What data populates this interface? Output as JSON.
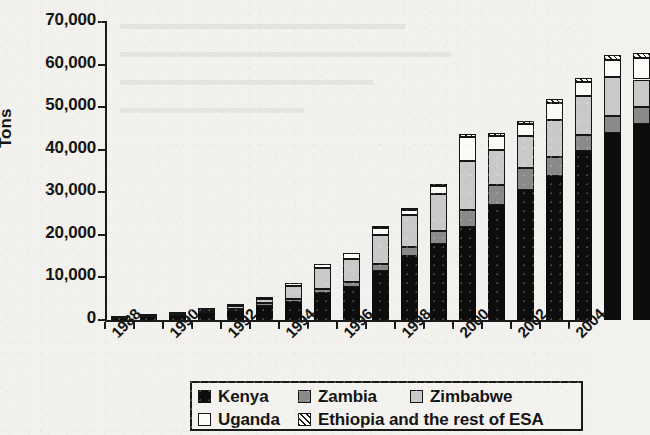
{
  "chart_data": {
    "type": "bar",
    "subtype": "stacked-column",
    "title": "",
    "xlabel": "",
    "ylabel": "Tons",
    "ylim": [
      0,
      70000
    ],
    "ytick_step": 10000,
    "ytick_labels": [
      "0",
      "10,000",
      "20,000",
      "30,000",
      "40,000",
      "50,000",
      "60,000",
      "70,000"
    ],
    "ytick_values": [
      0,
      10000,
      20000,
      30000,
      40000,
      50000,
      60000,
      70000
    ],
    "grid": false,
    "legend_position": "bottom",
    "x_label_rotation": -45,
    "note": "Right edge of plot is cropped; final column is clipped by the image border.",
    "categories": [
      1988,
      1989,
      1990,
      1991,
      1992,
      1993,
      1994,
      1995,
      1996,
      1997,
      1998,
      1999,
      2000,
      2001,
      2002,
      2003,
      2004,
      2005,
      2006
    ],
    "xtick_labels_shown": [
      "1988",
      "1990",
      "1992",
      "1994",
      "1996",
      "1998",
      "2000",
      "2002",
      "2004"
    ],
    "series": [
      {
        "name": "Kenya",
        "color": "#0d0d0d",
        "pattern": "solid",
        "values": [
          300,
          600,
          900,
          1600,
          2200,
          3400,
          4200,
          6400,
          7700,
          11500,
          15000,
          17800,
          21800,
          27000,
          30500,
          33800,
          39800,
          44000,
          46000
        ]
      },
      {
        "name": "Zambia",
        "color": "#8a8a8a",
        "pattern": "solid",
        "values": [
          100,
          150,
          250,
          300,
          400,
          500,
          700,
          900,
          1200,
          1600,
          2200,
          3200,
          4100,
          4800,
          5200,
          4400,
          3600,
          3900,
          4000
        ]
      },
      {
        "name": "Zimbabwe",
        "color": "#c9c9c9",
        "pattern": "solid",
        "values": [
          100,
          150,
          300,
          500,
          800,
          1000,
          3200,
          4900,
          5400,
          6900,
          7400,
          8600,
          11400,
          8200,
          7600,
          8900,
          9200,
          9100,
          6500
        ]
      },
      {
        "name": "Uganda",
        "color": "#fbfbf8",
        "pattern": "solid",
        "values": [
          50,
          100,
          150,
          200,
          250,
          350,
          700,
          1000,
          1500,
          1600,
          1300,
          1800,
          5600,
          3200,
          2800,
          3900,
          3200,
          4000,
          5000
        ]
      },
      {
        "name": "Ethiopia and the rest of ESA",
        "color": "#fbfbf8",
        "pattern": "diagonal-hatch",
        "values": [
          0,
          0,
          0,
          0,
          0,
          0,
          0,
          0,
          0,
          200,
          200,
          300,
          700,
          800,
          700,
          900,
          1100,
          1200,
          1300
        ]
      }
    ],
    "totals": [
      550,
      1000,
      1600,
      2600,
      3650,
      5250,
      8800,
      13200,
      15800,
      21800,
      26100,
      31700,
      43600,
      44000,
      46800,
      51900,
      56900,
      62200,
      62800
    ]
  },
  "legend": {
    "items": [
      {
        "label": "Kenya",
        "swatch": "solid-black"
      },
      {
        "label": "Zambia",
        "swatch": "solid-dark-gray"
      },
      {
        "label": "Zimbabwe",
        "swatch": "solid-light-gray"
      },
      {
        "label": "Uganda",
        "swatch": "solid-white"
      },
      {
        "label": "Ethiopia and the rest of ESA",
        "swatch": "diagonal-hatch"
      }
    ]
  }
}
